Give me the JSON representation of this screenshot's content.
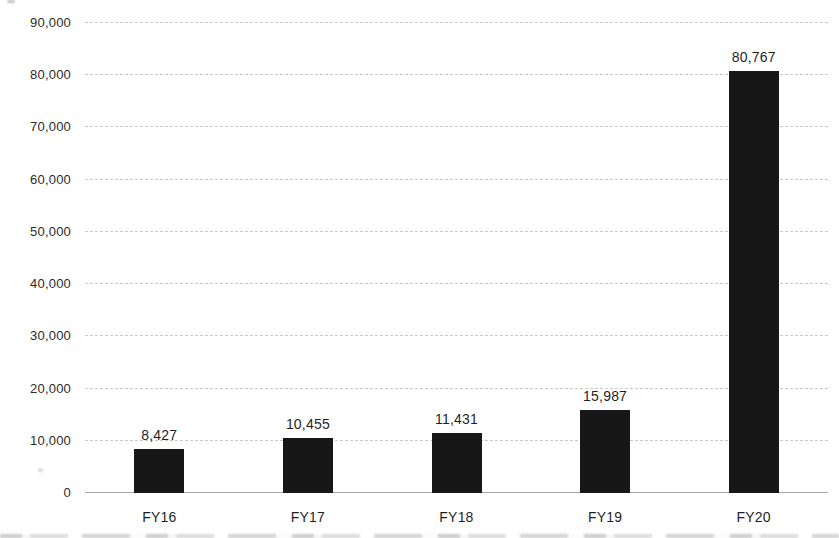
{
  "chart_data": {
    "type": "bar",
    "title": "",
    "xlabel": "",
    "ylabel": "",
    "categories": [
      "FY16",
      "FY17",
      "FY18",
      "FY19",
      "FY20"
    ],
    "values": [
      8427,
      10455,
      11431,
      15987,
      80767
    ],
    "value_labels": [
      "8,427",
      "10,455",
      "11,431",
      "15,987",
      "80,767"
    ],
    "ylim": [
      0,
      90000
    ],
    "ytick_values": [
      0,
      10000,
      20000,
      30000,
      40000,
      50000,
      60000,
      70000,
      80000,
      90000
    ],
    "ytick_labels": [
      "0",
      "10,000",
      "20,000",
      "30,000",
      "40,000",
      "50,000",
      "60,000",
      "70,000",
      "80,000",
      "90,000"
    ],
    "grid": "horizontal-dashed",
    "legend": "none",
    "bar_color": "#171717",
    "gridline_color": "#c9c9c9",
    "axis_line_color": "#a6a6a6",
    "text_color": "#1f1f1f"
  }
}
